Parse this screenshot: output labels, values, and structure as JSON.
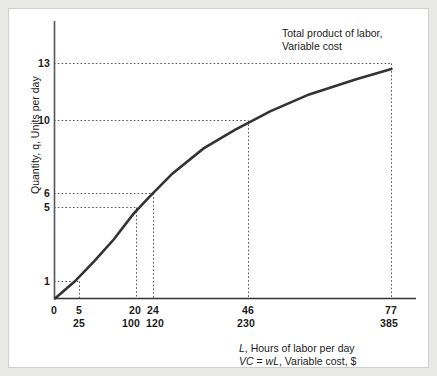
{
  "figure": {
    "background_color": "#ffffff",
    "page_color": "#e9e9e7",
    "curve_color": "#333333",
    "axis_color": "#444444",
    "guide_color": "#555555"
  },
  "annotation": {
    "line1": "Total product of labor,",
    "line2": "Variable cost"
  },
  "axes": {
    "y_label": "Quantity, q, Units per day",
    "y_label_plain": "Quantity, q, Units per day",
    "x_title_line1_italic": "L",
    "x_title_line1_rest": ", Hours of labor per day",
    "x_title_line2_italic1": "VC",
    "x_title_line2_mid": " = ",
    "x_title_line2_italic2": "wL",
    "x_title_line2_rest": ", Variable cost, $",
    "origin_label": "0"
  },
  "chart_data": {
    "type": "line",
    "title": "Total product of labor, Variable cost",
    "xlabel": "L, Hours of labor per day / VC = wL, Variable cost, $",
    "ylabel": "Quantity, q, Units per day",
    "xlim": [
      0,
      90
    ],
    "ylim": [
      0,
      14.2
    ],
    "grid": false,
    "legend": "none",
    "x_tick_labels_hours": [
      "0",
      "5",
      "20",
      "24",
      "46",
      "77"
    ],
    "x_tick_values_hours": [
      0,
      5,
      20,
      24,
      46,
      77
    ],
    "x_tick_labels_cost": [
      "25",
      "100",
      "120",
      "230",
      "385"
    ],
    "x_tick_values_cost": [
      25,
      100,
      120,
      230,
      385
    ],
    "y_tick_labels": [
      "1",
      "5",
      "6",
      "10",
      "13"
    ],
    "y_tick_values": [
      1,
      5,
      6,
      10,
      13
    ],
    "marked_points": [
      {
        "L": 5,
        "VC": 25,
        "q": 1
      },
      {
        "L": 20,
        "VC": 100,
        "q": 5
      },
      {
        "L": 24,
        "VC": 120,
        "q": 6
      },
      {
        "L": 46,
        "VC": 230,
        "q": 10
      },
      {
        "L": 77,
        "VC": 385,
        "q": 13
      }
    ],
    "series": [
      {
        "name": "Total product of labor / Variable cost",
        "x": [
          0,
          5,
          10,
          15,
          20,
          24,
          30,
          38,
          46,
          55,
          65,
          77,
          86
        ],
        "values": [
          0,
          1,
          2.2,
          3.5,
          5,
          6,
          7.4,
          8.9,
          10,
          11.1,
          12.1,
          13,
          13.6
        ]
      }
    ]
  }
}
